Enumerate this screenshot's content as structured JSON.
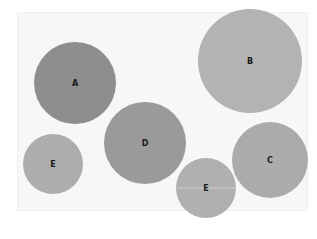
{
  "diagram": {
    "type": "bubble-diagram",
    "colors": {
      "background": "#ffffff",
      "panel": "#f7f7f7",
      "dark": "#8c8c8c",
      "medium": "#9a9a9a",
      "light": "#b0b0b0"
    },
    "bubbles": [
      {
        "label": "A",
        "cx": 75,
        "cy": 83,
        "r": 41,
        "color": "#8e8e8e"
      },
      {
        "label": "B",
        "cx": 250,
        "cy": 61,
        "r": 52,
        "color": "#b3b3b3"
      },
      {
        "label": "D",
        "cx": 145,
        "cy": 143,
        "r": 41,
        "color": "#9a9a9a"
      },
      {
        "label": "E",
        "cx": 53,
        "cy": 164,
        "r": 30,
        "color": "#adadad"
      },
      {
        "label": "C",
        "cx": 270,
        "cy": 160,
        "r": 38,
        "color": "#ababab"
      },
      {
        "label": "E",
        "cx": 206,
        "cy": 188,
        "r": 30,
        "color": "#b0b0b0"
      }
    ]
  }
}
